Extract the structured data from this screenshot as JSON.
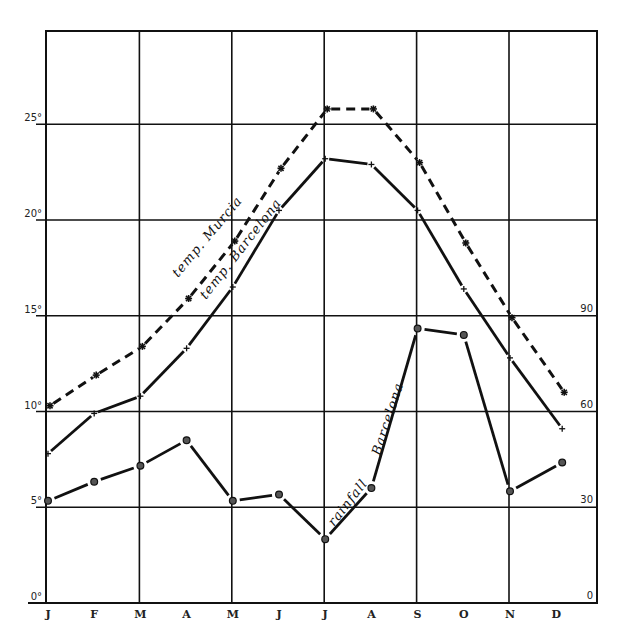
{
  "chart_data": {
    "type": "line",
    "title": "",
    "xlabel": "",
    "ylabel": "",
    "categories": [
      "J",
      "F",
      "M",
      "A",
      "M",
      "J",
      "J",
      "A",
      "S",
      "O",
      "N",
      "D"
    ],
    "y_left": {
      "unit": "°",
      "ticks": [
        0,
        5,
        10,
        15,
        20,
        25
      ],
      "tick_labels": [
        "0°",
        "5°",
        "10°",
        "15°",
        "20°",
        "25°"
      ],
      "range": [
        0,
        28.8
      ]
    },
    "y_right": {
      "ticks": [
        0,
        30,
        60,
        90
      ],
      "tick_labels": [
        "0",
        "30",
        "60",
        "90"
      ],
      "range": [
        0,
        172.8
      ]
    },
    "grid": true,
    "legend": "inline labels along lines",
    "series": [
      {
        "name": "temp. Murcia",
        "axis": "left",
        "style": "dashed",
        "marker": "asterisk",
        "values": [
          10.3,
          11.9,
          13.4,
          15.9,
          18.9,
          22.7,
          25.8,
          25.8,
          23.0,
          18.8,
          14.9,
          11.0
        ]
      },
      {
        "name": "temp. Barcelona",
        "axis": "left",
        "style": "solid",
        "marker": "cross",
        "values": [
          7.8,
          9.9,
          10.8,
          13.3,
          16.5,
          20.5,
          23.2,
          22.9,
          20.5,
          16.4,
          12.8,
          9.1
        ]
      },
      {
        "name": "rainfall Barcelona",
        "axis": "right",
        "style": "solid",
        "marker": "circle",
        "values": [
          32,
          38,
          43,
          51,
          32,
          34,
          20,
          36,
          86,
          84,
          35,
          44
        ]
      }
    ]
  },
  "labels": {
    "murcia": "temp. Murcia",
    "barcelona": "temp. Barcelona",
    "rain_part1": "rainfall",
    "rain_part2": "Barcelona"
  }
}
